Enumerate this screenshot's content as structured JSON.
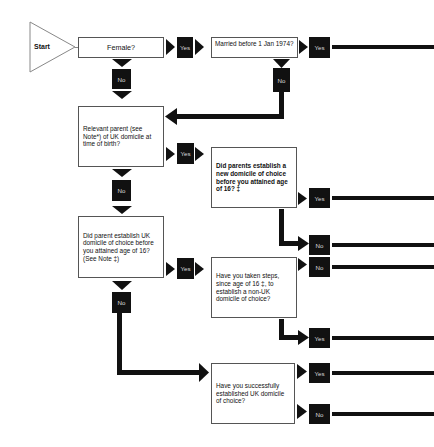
{
  "diagram": {
    "type": "flowchart",
    "start": {
      "label": "Start"
    },
    "nodes": [
      {
        "id": "female",
        "text": "Female?"
      },
      {
        "id": "married",
        "text": "Married before 1 Jan 1974?"
      },
      {
        "id": "relevant_parent",
        "text": "Relevant parent (see Note*) of UK domicile at time of birth?"
      },
      {
        "id": "parents_new_domicile",
        "text": "Did parents establish a new domicile of choice before you attained age of 16? ‡"
      },
      {
        "id": "parent_uk_domicile",
        "text": "Did parent establish UK domicile of choice before you attained age of 16? (See Note ‡)"
      },
      {
        "id": "taken_steps",
        "text": "Have you taken steps, since age of 16 ‡, to establish a non-UK domicile of choice?"
      },
      {
        "id": "successfully_established",
        "text": "Have you successfully established UK domicile of choice?"
      }
    ],
    "labels": {
      "yes": "Yes",
      "no": "No"
    },
    "edges": [
      {
        "from": "start",
        "to": "female"
      },
      {
        "from": "female",
        "to": "married",
        "label": "Yes"
      },
      {
        "from": "female",
        "to": "relevant_parent",
        "label": "No"
      },
      {
        "from": "married",
        "to": "offpage-1",
        "label": "Yes"
      },
      {
        "from": "married",
        "to": "relevant_parent",
        "label": "No"
      },
      {
        "from": "relevant_parent",
        "to": "parents_new_domicile",
        "label": "Yes"
      },
      {
        "from": "relevant_parent",
        "to": "parent_uk_domicile",
        "label": "No"
      },
      {
        "from": "parents_new_domicile",
        "to": "offpage-2",
        "label": "Yes"
      },
      {
        "from": "parents_new_domicile",
        "to": "offpage-3",
        "label": "No"
      },
      {
        "from": "parent_uk_domicile",
        "to": "taken_steps",
        "label": "Yes"
      },
      {
        "from": "parent_uk_domicile",
        "to": "successfully_established",
        "label": "No"
      },
      {
        "from": "taken_steps",
        "to": "offpage-4",
        "label": "No"
      },
      {
        "from": "taken_steps",
        "to": "offpage-5",
        "label": "Yes"
      },
      {
        "from": "successfully_established",
        "to": "offpage-6",
        "label": "Yes"
      },
      {
        "from": "successfully_established",
        "to": "offpage-7",
        "label": "No"
      }
    ]
  }
}
